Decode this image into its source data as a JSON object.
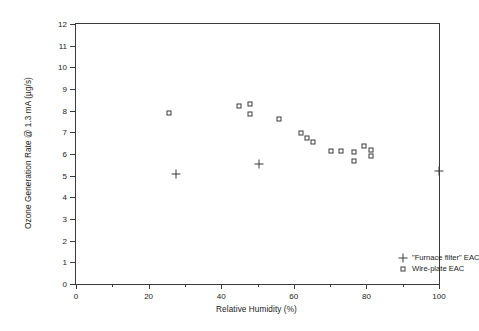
{
  "chart_data": {
    "type": "scatter",
    "title": "",
    "xlabel": "Relative Humidity (%)",
    "ylabel": "Ozone Generation Rate @ 1.3 mA (µg/s)",
    "xlim": [
      0,
      100
    ],
    "ylim": [
      0,
      12
    ],
    "xticks": [
      0,
      20,
      40,
      60,
      80,
      100
    ],
    "xticks_minor": [
      10,
      30,
      50,
      70,
      90
    ],
    "yticks": [
      0,
      1,
      2,
      3,
      4,
      5,
      6,
      7,
      8,
      9,
      10,
      11,
      12
    ],
    "grid": false,
    "legend_position": "inside-bottom-right",
    "series": [
      {
        "name": "\"Furnace filter\" EAC",
        "marker": "plus",
        "color": "#3a3a3a",
        "points": [
          {
            "x": 27.5,
            "y": 5.1
          },
          {
            "x": 50.5,
            "y": 5.55
          },
          {
            "x": 100.0,
            "y": 5.2
          }
        ]
      },
      {
        "name": "Wire-plate EAC",
        "marker": "square",
        "color": "#3a3a3a",
        "points": [
          {
            "x": 25.6,
            "y": 7.9
          },
          {
            "x": 44.9,
            "y": 8.2
          },
          {
            "x": 47.9,
            "y": 8.3
          },
          {
            "x": 47.9,
            "y": 7.85
          },
          {
            "x": 55.9,
            "y": 7.6
          },
          {
            "x": 62.0,
            "y": 6.95
          },
          {
            "x": 63.6,
            "y": 6.75
          },
          {
            "x": 65.3,
            "y": 6.55
          },
          {
            "x": 70.2,
            "y": 6.15
          },
          {
            "x": 72.9,
            "y": 6.15
          },
          {
            "x": 76.6,
            "y": 6.1
          },
          {
            "x": 76.6,
            "y": 5.7
          },
          {
            "x": 79.3,
            "y": 6.35
          },
          {
            "x": 81.2,
            "y": 6.2
          },
          {
            "x": 81.2,
            "y": 5.9
          }
        ]
      }
    ]
  },
  "axis": {
    "y_tick_labels": [
      "0",
      "1",
      "2",
      "3",
      "4",
      "5",
      "6",
      "7",
      "8",
      "9",
      "10",
      "11",
      "12"
    ],
    "x_tick_labels": [
      "0",
      "20",
      "40",
      "60",
      "80",
      "100"
    ],
    "x_title": "Relative Humidity (%)",
    "y_title": "Ozone Generation Rate @ 1.3 mA (µg/s)"
  },
  "legend": {
    "entries": [
      {
        "label": "\"Furnace filter\" EAC",
        "marker": "plus"
      },
      {
        "label": "Wire-plate EAC",
        "marker": "square"
      }
    ]
  }
}
